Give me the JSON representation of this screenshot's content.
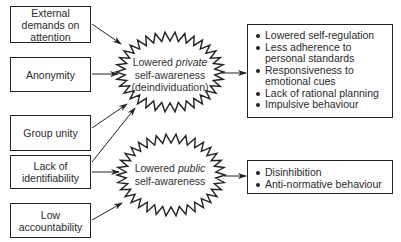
{
  "causes": [
    {
      "label": "External demands on attention"
    },
    {
      "label": "Anonymity"
    },
    {
      "label": "Group unity"
    },
    {
      "label": "Lack of identifiability"
    },
    {
      "label": "Low accountability"
    }
  ],
  "states": {
    "private": {
      "prefix": "Lowered ",
      "emphasis": "private",
      "line2": "self-awareness",
      "line3": "(deindividuation)"
    },
    "public": {
      "prefix": "Lowered ",
      "emphasis": "public",
      "line2": "self-awareness"
    }
  },
  "outcomes": {
    "private": [
      "Lowered self-regulation",
      "Less adherence to personal standards",
      "Responsiveness to emotional cues",
      "Lack of rational planning",
      "Impulsive behaviour"
    ],
    "public": [
      "Disinhibition",
      "Anti-normative behaviour"
    ]
  },
  "colors": {
    "stroke": "#222222",
    "text": "#2a2a2a"
  }
}
